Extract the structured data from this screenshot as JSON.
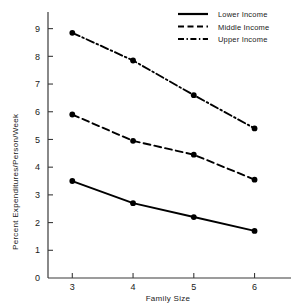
{
  "chart_data": {
    "type": "line",
    "title": "",
    "xlabel": "Family Size",
    "ylabel": "Percent Expenditures/Person/Week",
    "x": [
      3,
      4,
      5,
      6
    ],
    "xticklabels": [
      "3",
      "4",
      "5",
      "6"
    ],
    "yticklabels": [
      "0",
      "1",
      "2",
      "3",
      "4",
      "5",
      "6",
      "7",
      "8",
      "9"
    ],
    "xlim": [
      2.6,
      6.6
    ],
    "ylim": [
      0,
      9.6
    ],
    "grid": false,
    "legend_position": "top-right",
    "series": [
      {
        "name": "Lower Income",
        "style": "solid",
        "values": [
          3.5,
          2.7,
          2.2,
          1.7
        ]
      },
      {
        "name": "Middle Income",
        "style": "dashed",
        "values": [
          5.9,
          4.95,
          4.45,
          3.55
        ]
      },
      {
        "name": "Upper Income",
        "style": "dash-dot",
        "values": [
          8.85,
          7.85,
          6.6,
          5.4
        ]
      }
    ]
  },
  "legend": {
    "entries": [
      {
        "label": "Lower Income"
      },
      {
        "label": "Middle Income"
      },
      {
        "label": "Upper Income"
      }
    ]
  },
  "axes": {
    "x_title": "Family Size",
    "y_title": "Percent Expenditures/Person/Week"
  },
  "colors": {
    "ink": "#000000",
    "axis": "#3a3a3a",
    "background": "#ffffff"
  }
}
